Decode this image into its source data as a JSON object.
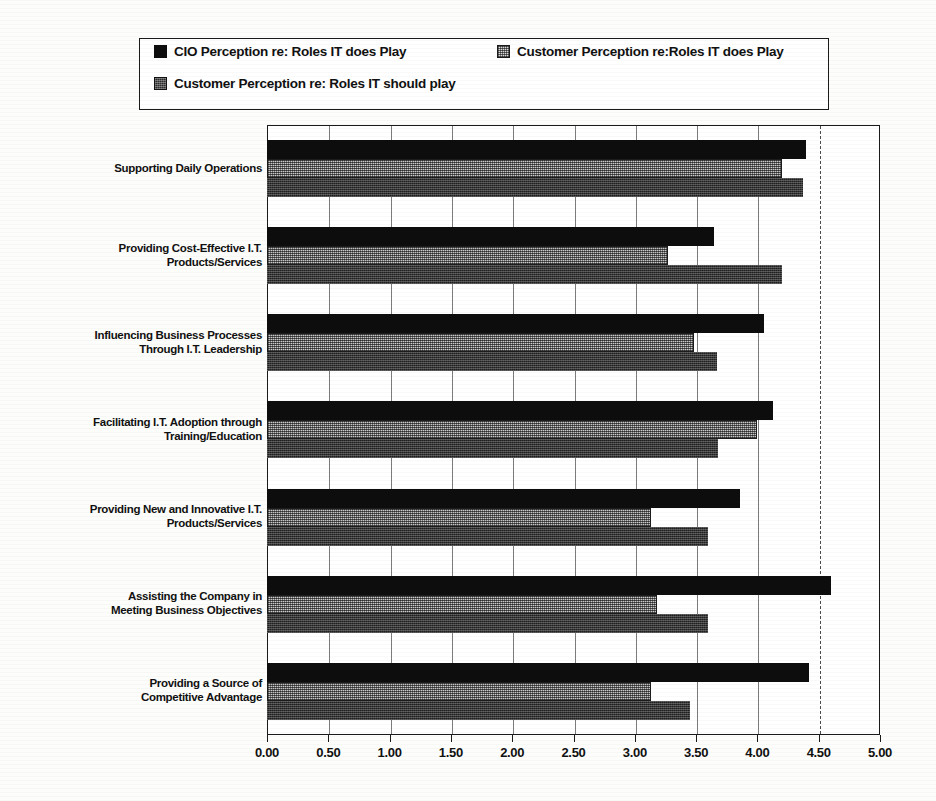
{
  "legend": {
    "entries": [
      {
        "label": "CIO Perception re:  Roles IT does Play",
        "swatch": "solid-black-swatch"
      },
      {
        "label": "Customer Perception re:Roles IT does Play",
        "swatch": "light-hatch-swatch"
      },
      {
        "label": "Customer Perception re:  Roles IT should play",
        "swatch": "dark-hatch-swatch"
      }
    ]
  },
  "chart_data": {
    "type": "bar",
    "orientation": "horizontal",
    "title": "",
    "xlabel": "",
    "ylabel": "",
    "xlim": [
      0,
      5
    ],
    "xticks": [
      "0.00",
      "0.50",
      "1.00",
      "1.50",
      "2.00",
      "2.50",
      "3.00",
      "3.50",
      "4.00",
      "4.50",
      "5.00"
    ],
    "xtick_values": [
      0,
      0.5,
      1,
      1.5,
      2,
      2.5,
      3,
      3.5,
      4,
      4.5,
      5
    ],
    "grid": true,
    "legend_position": "top",
    "categories": [
      "Supporting Daily Operations",
      "Providing Cost-Effective I.T. Products/Services",
      "Influencing Business Processes Through I.T. Leadership",
      "Facilitating I.T. Adoption through Training/Education",
      "Providing New and Innovative I.T. Products/Services",
      "Assisting the Company in Meeting Business Objectives",
      "Providing a Source of Competitive Advantage"
    ],
    "category_lines": [
      [
        "Supporting Daily Operations"
      ],
      [
        "Providing Cost-Effective I.T.",
        "Products/Services"
      ],
      [
        "Influencing Business Processes",
        "Through I.T. Leadership"
      ],
      [
        "Facilitating I.T. Adoption through",
        "Training/Education"
      ],
      [
        "Providing New and Innovative I.T.",
        "Products/Services"
      ],
      [
        "Assisting the Company in",
        "Meeting Business Objectives"
      ],
      [
        "Providing a Source of",
        "Competitive Advantage"
      ]
    ],
    "series": [
      {
        "name": "CIO Perception re:  Roles IT does Play",
        "values": [
          4.4,
          3.65,
          4.05,
          4.13,
          3.86,
          4.6,
          4.42
        ]
      },
      {
        "name": "Customer Perception re:Roles IT does Play",
        "values": [
          4.2,
          3.27,
          3.48,
          4.0,
          3.13,
          3.18,
          3.13
        ]
      },
      {
        "name": "Customer Perception re:  Roles IT should play",
        "values": [
          4.37,
          4.2,
          3.67,
          3.68,
          3.6,
          3.6,
          3.45
        ]
      }
    ]
  }
}
